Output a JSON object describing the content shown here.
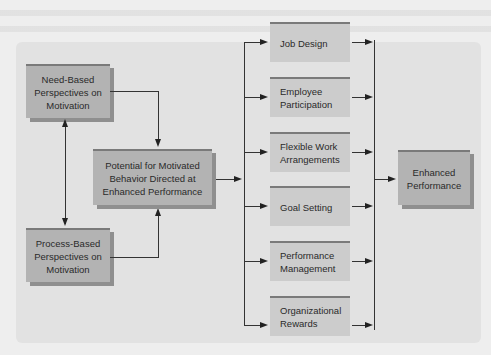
{
  "diagram": {
    "left_column": {
      "need_based": "Need-Based Perspectives on Motivation",
      "process_based": "Process-Based Perspectives on Motivation"
    },
    "center": {
      "potential": "Potential for Motivated Behavior Directed at Enhanced Performance"
    },
    "strategies": [
      {
        "label": "Job Design"
      },
      {
        "label": "Employee Participation"
      },
      {
        "label": "Flexible Work Arrangements"
      },
      {
        "label": "Goal Setting"
      },
      {
        "label": "Performance Management"
      },
      {
        "label": "Organizational Rewards"
      }
    ],
    "outcome": {
      "label": "Enhanced Performance"
    },
    "colors": {
      "dark_box": "#b3b3b3",
      "light_box": "#cccccc",
      "panel": "#e2e2e2",
      "lines": "#333333"
    }
  }
}
